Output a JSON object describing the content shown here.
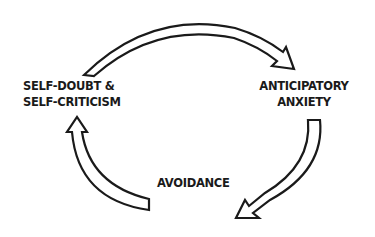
{
  "diagram": {
    "type": "cycle",
    "nodes": [
      {
        "id": "self_doubt",
        "line1": "SELF-DOUBT &",
        "line2": "SELF-CRITICISM"
      },
      {
        "id": "anticipatory",
        "line1": "ANTICIPATORY",
        "line2": "ANXIETY"
      },
      {
        "id": "avoidance",
        "line1": "AVOIDANCE"
      }
    ],
    "edges": [
      {
        "from": "self_doubt",
        "to": "anticipatory",
        "style": "hollow-curved-arrow"
      },
      {
        "from": "anticipatory",
        "to": "avoidance",
        "style": "hollow-curved-arrow"
      },
      {
        "from": "avoidance",
        "to": "self_doubt",
        "style": "hollow-curved-arrow"
      }
    ],
    "colors": {
      "stroke": "#1a1a1a",
      "fill": "#ffffff",
      "text": "#1a1a1a"
    }
  }
}
